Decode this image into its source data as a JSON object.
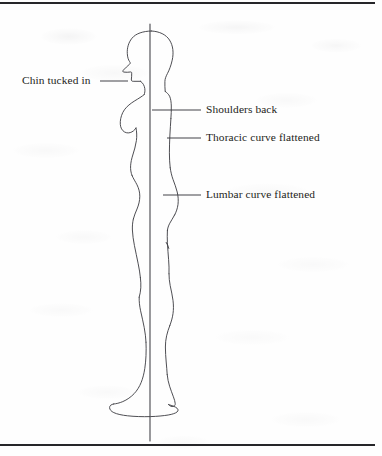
{
  "page": {
    "background_color": "#fefefe",
    "ink_color": "#3a3a40",
    "text_color": "#1d1d20",
    "width": 382,
    "height": 456
  },
  "rules": {
    "top_rule_label": "top-horizontal-rule",
    "bottom_rule_label": "bottom-horizontal-rule"
  },
  "figure": {
    "plumb_line_label": "vertical-plumb-line",
    "plumb_line_x": 150
  },
  "annotations": [
    {
      "id": "chin",
      "text": "Chin tucked in",
      "side": "left",
      "leader_from_x": 128,
      "leader_to_x": 100,
      "leader_y": 81
    },
    {
      "id": "shoulders",
      "text": "Shoulders back",
      "side": "right",
      "leader_from_x": 152,
      "leader_to_x": 201,
      "leader_y": 110
    },
    {
      "id": "thoracic",
      "text": "Thoracic curve flattened",
      "side": "right",
      "leader_from_x": 167,
      "leader_to_x": 201,
      "leader_y": 138
    },
    {
      "id": "lumbar",
      "text": "Lumbar curve flattened",
      "side": "right",
      "leader_from_x": 163,
      "leader_to_x": 201,
      "leader_y": 195
    }
  ]
}
